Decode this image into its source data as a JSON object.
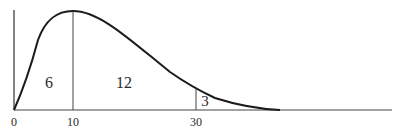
{
  "figure": {
    "type": "skewed density curve with partitioned areas",
    "x_ticks": [
      {
        "value": "0",
        "px": 14
      },
      {
        "value": "10",
        "px": 73
      },
      {
        "value": "30",
        "px": 196
      }
    ],
    "region_labels": [
      {
        "text": "6",
        "x": 49,
        "y": 88
      },
      {
        "text": "12",
        "x": 124,
        "y": 88
      },
      {
        "text": "3",
        "x": 205,
        "y": 106
      }
    ],
    "colors": {
      "curve": "#1a1a1a",
      "axis": "#333333",
      "text": "#2a2a2a",
      "background": "#ffffff"
    }
  }
}
